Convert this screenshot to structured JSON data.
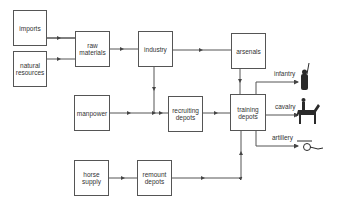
{
  "diagram": {
    "nodes": {
      "imports": "imports",
      "natural_resources": "natural resources",
      "raw_materials": "raw materials",
      "industry": "industry",
      "arsenals": "arsenals",
      "manpower": "manpower",
      "recruiting_depots": "recruiting depots",
      "training_depots": "training depots",
      "horse_supply": "horse supply",
      "remount_depots": "remount depots"
    },
    "outputs": {
      "infantry": "infantry",
      "cavalry": "cavalry",
      "artillery": "artillery"
    },
    "edges": [
      [
        "imports",
        "raw materials"
      ],
      [
        "natural resources",
        "raw materials"
      ],
      [
        "raw materials",
        "industry"
      ],
      [
        "industry",
        "arsenals"
      ],
      [
        "industry",
        "recruiting depots"
      ],
      [
        "manpower",
        "recruiting depots"
      ],
      [
        "recruiting depots",
        "training depots"
      ],
      [
        "arsenals",
        "training depots"
      ],
      [
        "horse supply",
        "remount depots"
      ],
      [
        "remount depots",
        "training depots"
      ],
      [
        "training depots",
        "infantry"
      ],
      [
        "training depots",
        "cavalry"
      ],
      [
        "training depots",
        "artillery"
      ]
    ]
  }
}
